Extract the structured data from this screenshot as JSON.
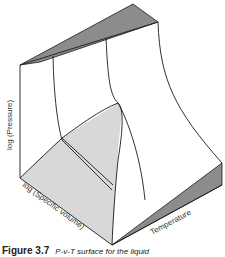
{
  "figure": {
    "caption_label": "Figure 3.7",
    "caption_text": "P-v-T surface for the liquid",
    "axes": {
      "vertical": "log (Pressure)",
      "depth": "log (Specific volume)",
      "horizontal": "Temperature"
    },
    "colors": {
      "line": "#1a1a1a",
      "dark_face": "#8c8c8c",
      "light_region": "#d8d8d8",
      "background": "#ffffff"
    }
  }
}
